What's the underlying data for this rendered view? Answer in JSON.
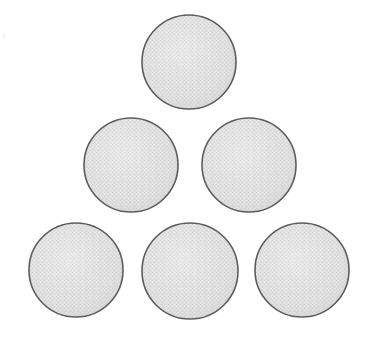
{
  "figure": {
    "background_color": "#ffffff",
    "canvas": {
      "width": 376,
      "height": 343
    },
    "object_count": "6",
    "arrangement": "triangle-3-2-1",
    "style": {
      "fill_color": "#d9d9d9",
      "fill_highlight_color": "#e2e2e2",
      "texture": "halftone-noise",
      "stroke_color": "#5c5c5c",
      "stroke_width": "1.6"
    },
    "rows": [
      {
        "name": "top-row",
        "count": "1"
      },
      {
        "name": "middle-row",
        "count": "2"
      },
      {
        "name": "bottom-row",
        "count": "3"
      }
    ],
    "circles": [
      {
        "id": "circle-top-1",
        "row": "top-row",
        "label": "1",
        "cx": 189,
        "cy": 62,
        "r": 47
      },
      {
        "id": "circle-middle-1",
        "row": "middle-row",
        "label": "2",
        "cx": 131,
        "cy": 165,
        "r": 47
      },
      {
        "id": "circle-middle-2",
        "row": "middle-row",
        "label": "3",
        "cx": 249,
        "cy": 165,
        "r": 47
      },
      {
        "id": "circle-bottom-1",
        "row": "bottom-row",
        "label": "4",
        "cx": 76,
        "cy": 270,
        "r": 47
      },
      {
        "id": "circle-bottom-2",
        "row": "bottom-row",
        "label": "5",
        "cx": 190,
        "cy": 271,
        "r": 48
      },
      {
        "id": "circle-bottom-3",
        "row": "bottom-row",
        "label": "6",
        "cx": 302,
        "cy": 270,
        "r": 47
      }
    ],
    "artifacts": [
      {
        "name": "scan-speck-left",
        "x": 2,
        "y": 33
      }
    ]
  }
}
